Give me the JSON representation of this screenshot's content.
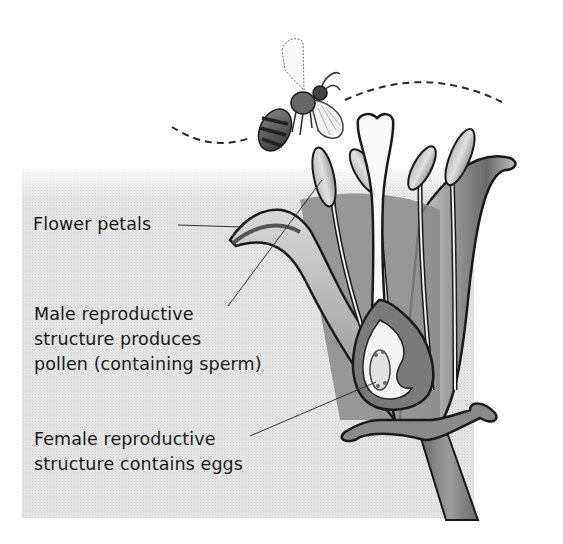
{
  "diagram": {
    "labels": {
      "petals": {
        "lines": [
          "Flower petals"
        ]
      },
      "male": {
        "lines": [
          "Male reproductive",
          "structure produces",
          "pollen (containing sperm)"
        ]
      },
      "female": {
        "lines": [
          "Female reproductive",
          "structure contains eggs"
        ]
      }
    },
    "parts": [
      {
        "id": "bee",
        "name": "Bee (pollinator)"
      },
      {
        "id": "flight-path",
        "name": "Bee flight path (dashed)"
      },
      {
        "id": "petals",
        "name": "Flower petals"
      },
      {
        "id": "stamens",
        "name": "Stamens / anthers",
        "count": 4
      },
      {
        "id": "pistil",
        "name": "Pistil with ovary"
      },
      {
        "id": "sepals",
        "name": "Sepals"
      },
      {
        "id": "stem",
        "name": "Stem"
      }
    ],
    "colors": {
      "panel": "#e4e4e4",
      "ink": "#1a1a1a",
      "petal_dark": "#5a5a5a",
      "petal_light": "#d8d8d8"
    }
  }
}
